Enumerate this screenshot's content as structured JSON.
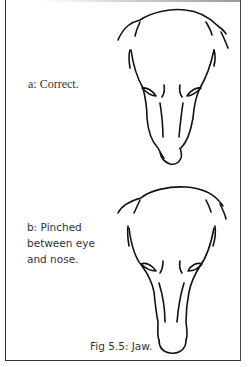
{
  "figure": {
    "caption": "Fig 5.5: Jaw.",
    "panels": [
      {
        "id": "a",
        "label": "a: Correct."
      },
      {
        "id": "b",
        "label_lines": [
          "b: Pinched",
          "between eye",
          "and nose."
        ]
      }
    ]
  }
}
